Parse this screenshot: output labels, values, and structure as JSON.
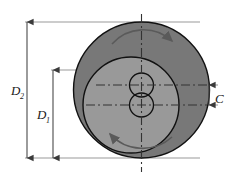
{
  "figure": {
    "background_color": "#ffffff",
    "width": 243,
    "height": 177
  },
  "colors": {
    "outer_disc_fill": "#787878",
    "inner_disc_fill": "#999999",
    "outline_stroke": "#111111",
    "dimension_line": "#8c8c8c",
    "centerline": "#333333",
    "arrow_stroke": "#5a5a5a",
    "text": "#1a1a1a"
  },
  "shapes": {
    "outer_disc": {
      "name": "outer-disc",
      "cx": 141.5,
      "cy": 90,
      "r": 68,
      "fill": "#787878"
    },
    "inner_disc": {
      "name": "inner-disc",
      "cx": 131,
      "cy": 105,
      "r": 48,
      "fill": "#999999"
    },
    "upper_bore": {
      "name": "upper-bore",
      "cx": 141.5,
      "cy": 85,
      "r": 12
    },
    "lower_bore": {
      "name": "lower-bore",
      "cx": 141.5,
      "cy": 105,
      "r": 12
    }
  },
  "dimensions": [
    {
      "id": "D2",
      "label": "D",
      "subscript": "2",
      "description": "outer disc diameter",
      "orientation": "vertical",
      "line_x": 27,
      "top_y": 22,
      "bottom_y": 158,
      "label_x": 16,
      "label_y": 94
    },
    {
      "id": "D1",
      "label": "D",
      "subscript": "1",
      "description": "inner disc diameter",
      "orientation": "vertical",
      "line_x": 53,
      "top_y": 70,
      "bottom_y": 158,
      "label_x": 42,
      "label_y": 118
    },
    {
      "id": "C",
      "label": "C",
      "subscript": "",
      "description": "offset between bore centerlines",
      "orientation": "vertical",
      "line_x": 209,
      "top_y": 85,
      "bottom_y": 105,
      "label_x": 216,
      "label_y": 102
    }
  ],
  "centerlines": [
    {
      "name": "vertical-axis-centerline",
      "orientation": "vertical",
      "x": 141.5,
      "from": 14,
      "to": 172
    },
    {
      "name": "upper-bore-centerline",
      "orientation": "horizontal",
      "y": 85,
      "from": 96,
      "to": 207
    },
    {
      "name": "lower-bore-centerline",
      "orientation": "horizontal",
      "y": 105,
      "from": 86,
      "to": 207
    }
  ],
  "extension_lines": [
    {
      "name": "extension-line-d2-top",
      "y": 22,
      "from_x": 25,
      "to_x": 200
    },
    {
      "name": "extension-line-d2-bottom",
      "y": 158,
      "from_x": 25,
      "to_x": 200
    },
    {
      "name": "extension-line-d1-top",
      "y": 70,
      "from_x": 51,
      "to_x": 200
    },
    {
      "name": "extension-line-c-top",
      "y": 85,
      "from_x": 196,
      "to_x": 218
    },
    {
      "name": "extension-line-c-bottom",
      "y": 105,
      "from_x": 178,
      "to_x": 218
    }
  ],
  "rotation_arrows": [
    {
      "name": "rotation-arrow-top",
      "description": "clockwise rotation indicator on outer disc",
      "path": "M 112 43 A 40 40 0 0 1 174 41",
      "arrowhead": {
        "x": 174,
        "y": 41,
        "angle": 55
      }
    },
    {
      "name": "rotation-arrow-bottom",
      "description": "rotation indicator on inner disc",
      "path": "M 170 139 A 42 42 0 0 1 110 136",
      "arrowhead": {
        "x": 110,
        "y": 136,
        "angle": 235
      }
    }
  ]
}
